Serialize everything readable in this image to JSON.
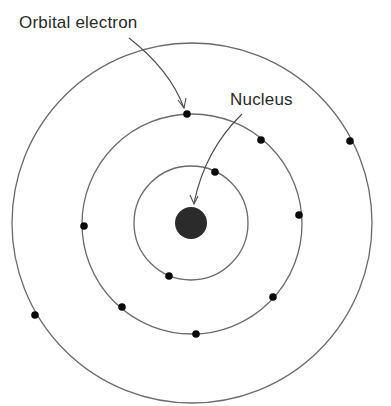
{
  "diagram": {
    "labels": {
      "orbital_electron": "Orbital electron",
      "nucleus": "Nucleus"
    },
    "colors": {
      "orbit_stroke": "#6a6a6a",
      "electron_fill": "#0a0a0a",
      "nucleus_fill": "#2b2b2b",
      "label_text": "#2a2a2a",
      "background": "#ffffff"
    },
    "center": {
      "x": 192,
      "y": 223
    },
    "nucleus": {
      "cx": 191,
      "cy": 223,
      "r": 16
    },
    "orbits": [
      {
        "name": "inner",
        "r": 57,
        "electrons": [
          [
            215,
            172
          ],
          [
            169,
            276
          ]
        ]
      },
      {
        "name": "middle",
        "r": 110,
        "electrons": [
          [
            187,
            114
          ],
          [
            261,
            140
          ],
          [
            299,
            215
          ],
          [
            84,
            226
          ],
          [
            122,
            307
          ],
          [
            273,
            297
          ],
          [
            196,
            334
          ]
        ]
      },
      {
        "name": "outer",
        "r": 180,
        "electrons": [
          [
            350,
            141
          ],
          [
            35,
            315
          ]
        ]
      }
    ],
    "arrows": [
      {
        "name": "orbital-electron-arrow",
        "from": [
          128,
          83
        ],
        "to": [
          185,
          110
        ]
      },
      {
        "name": "nucleus-arrow",
        "from": [
          242,
          115
        ],
        "to": [
          193,
          203
        ]
      }
    ]
  }
}
